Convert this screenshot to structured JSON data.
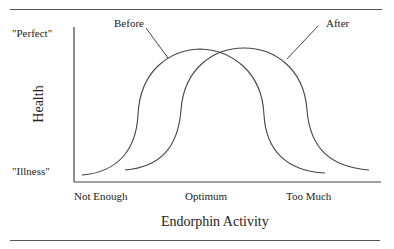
{
  "diagram": {
    "y_axis_label": "Health",
    "x_axis_label": "Endorphin Activity",
    "y_ticks": {
      "top": "\"Perfect\"",
      "bottom": "\"Illness\""
    },
    "x_ticks": [
      "Not Enough",
      "Optimum",
      "Too Much"
    ],
    "curves": [
      {
        "name": "Before",
        "shape": "bell"
      },
      {
        "name": "After",
        "shape": "bell",
        "shifted": "right"
      }
    ],
    "line_color": "#444444"
  }
}
